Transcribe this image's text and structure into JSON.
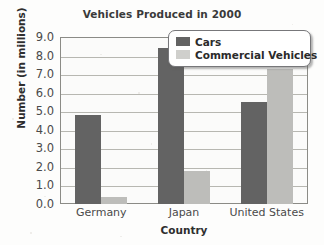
{
  "chart_data": {
    "type": "bar",
    "title": "Vehicles Produced in 2000",
    "xlabel": "Country",
    "ylabel": "Number (in millions)",
    "categories": [
      "Germany",
      "Japan",
      "United States"
    ],
    "series": [
      {
        "name": "Cars",
        "color": "#636363",
        "values": [
          4.8,
          8.4,
          5.5
        ]
      },
      {
        "name": "Commercial Vehicles",
        "color": "#bdbdba",
        "values": [
          0.4,
          1.8,
          7.3
        ]
      }
    ],
    "ylim": [
      0.0,
      9.0
    ],
    "ytick_step": 1.0,
    "yticks": [
      "9.0",
      "8.0",
      "7.0",
      "6.0",
      "5.0",
      "4.0",
      "3.0",
      "2.0",
      "1.0",
      "0.0"
    ],
    "grid": true,
    "legend_position": "top-right"
  },
  "legend": {
    "entries": [
      {
        "label": "Cars",
        "swatch": "legend-swatch-cars"
      },
      {
        "label": "Commercial Vehicles",
        "swatch": "legend-swatch-commercial"
      }
    ]
  }
}
